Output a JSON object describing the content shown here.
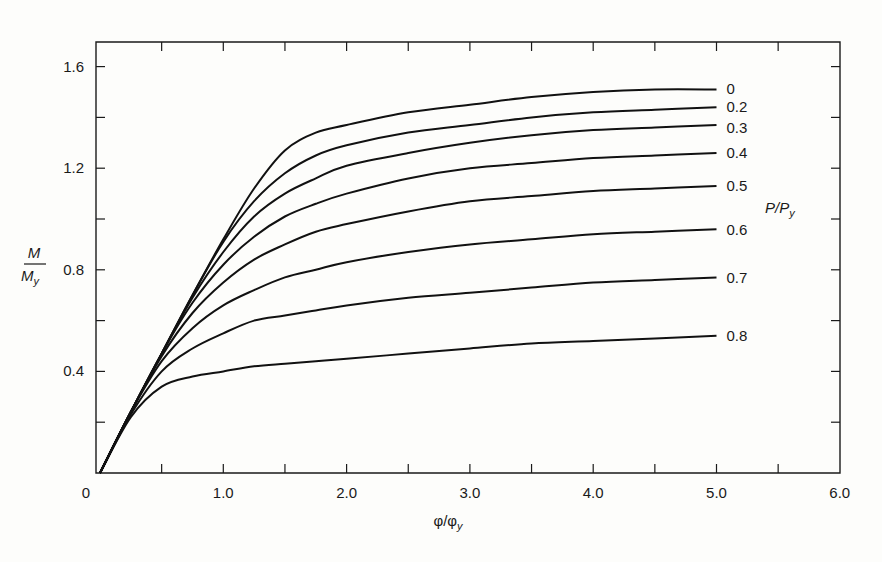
{
  "chart_data": {
    "type": "line",
    "title": "",
    "xlabel": "φ/φy",
    "ylabel": "M/My",
    "legend_title": "P/Py",
    "xlim": [
      0,
      6.0
    ],
    "ylim": [
      0,
      1.7
    ],
    "grid": false,
    "x_ticks": [
      0,
      0.5,
      1.0,
      1.5,
      2.0,
      2.5,
      3.0,
      3.5,
      4.0,
      4.5,
      5.0,
      5.5,
      6.0
    ],
    "x_tick_labels": [
      "0",
      "1.0",
      "2.0",
      "3.0",
      "4.0",
      "5.0",
      "6.0"
    ],
    "y_ticks": [
      0.2,
      0.4,
      0.6,
      0.8,
      1.0,
      1.2,
      1.4,
      1.6
    ],
    "y_tick_labels": [
      "0.4",
      "0.8",
      "1.2",
      "1.6"
    ],
    "x": [
      0,
      0.25,
      0.5,
      0.75,
      1.0,
      1.25,
      1.5,
      1.75,
      2.0,
      2.5,
      3.0,
      3.5,
      4.0,
      4.5,
      5.0
    ],
    "series": [
      {
        "name": "0",
        "values": [
          0,
          0.24,
          0.47,
          0.7,
          0.92,
          1.12,
          1.27,
          1.34,
          1.37,
          1.42,
          1.45,
          1.48,
          1.5,
          1.51,
          1.51
        ]
      },
      {
        "name": "0.2",
        "values": [
          0,
          0.24,
          0.47,
          0.7,
          0.91,
          1.07,
          1.18,
          1.25,
          1.29,
          1.34,
          1.37,
          1.4,
          1.42,
          1.43,
          1.44
        ]
      },
      {
        "name": "0.3",
        "values": [
          0,
          0.24,
          0.47,
          0.69,
          0.87,
          1.01,
          1.1,
          1.16,
          1.21,
          1.26,
          1.3,
          1.33,
          1.35,
          1.36,
          1.37
        ]
      },
      {
        "name": "0.4",
        "values": [
          0,
          0.24,
          0.47,
          0.67,
          0.82,
          0.93,
          1.01,
          1.06,
          1.1,
          1.16,
          1.2,
          1.22,
          1.24,
          1.25,
          1.26
        ]
      },
      {
        "name": "0.5",
        "values": [
          0,
          0.24,
          0.46,
          0.63,
          0.75,
          0.84,
          0.9,
          0.95,
          0.98,
          1.03,
          1.07,
          1.09,
          1.11,
          1.12,
          1.13
        ]
      },
      {
        "name": "0.6",
        "values": [
          0,
          0.24,
          0.44,
          0.57,
          0.66,
          0.72,
          0.77,
          0.8,
          0.83,
          0.87,
          0.9,
          0.92,
          0.94,
          0.95,
          0.96
        ]
      },
      {
        "name": "0.7",
        "values": [
          0,
          0.23,
          0.4,
          0.49,
          0.55,
          0.6,
          0.62,
          0.64,
          0.66,
          0.69,
          0.71,
          0.73,
          0.75,
          0.76,
          0.77
        ]
      },
      {
        "name": "0.8",
        "values": [
          0,
          0.22,
          0.34,
          0.38,
          0.4,
          0.42,
          0.43,
          0.44,
          0.45,
          0.47,
          0.49,
          0.51,
          0.52,
          0.53,
          0.54
        ]
      }
    ]
  },
  "axes": {
    "x_title": "φ/φ",
    "x_title_sub": "y",
    "y_title_num": "M",
    "y_title_den": "M",
    "y_title_den_sub": "y",
    "legend_title": "P/P",
    "legend_title_sub": "y"
  }
}
